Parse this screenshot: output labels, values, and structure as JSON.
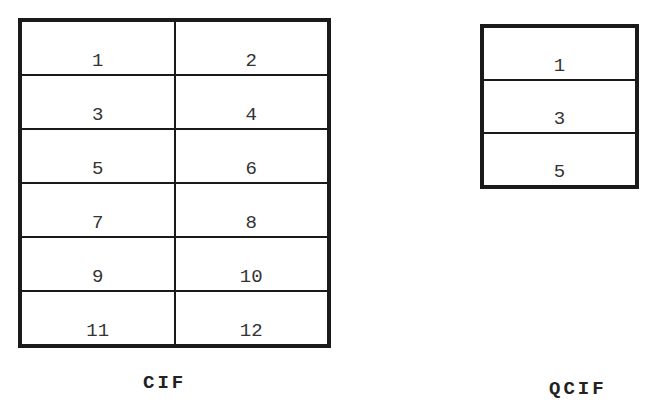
{
  "cif": {
    "label": "CIF",
    "rows": 6,
    "columns": 2,
    "cells": [
      "1",
      "2",
      "3",
      "4",
      "5",
      "6",
      "7",
      "8",
      "9",
      "10",
      "11",
      "12"
    ]
  },
  "qcif": {
    "label": "QCIF",
    "rows": 3,
    "columns": 1,
    "cells": [
      "1",
      "3",
      "5"
    ]
  },
  "colors": {
    "line": "#1a1a1a",
    "text": "#333333",
    "background": "#ffffff"
  }
}
